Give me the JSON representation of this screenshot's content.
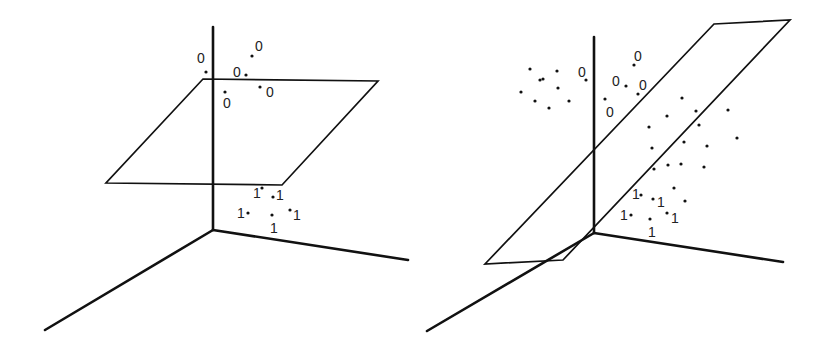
{
  "colors": {
    "ink": "#111111",
    "label": "#222222",
    "background": "#ffffff"
  },
  "panels": [
    {
      "name": "left-panel-horizontal-plane",
      "axes": {
        "origin": [
          213,
          230
        ],
        "vertical_top": [
          213,
          27
        ],
        "left_end": [
          45,
          330
        ],
        "right_end": [
          408,
          260
        ]
      },
      "plane": [
        [
          203,
          79
        ],
        [
          378,
          81
        ],
        [
          282,
          185
        ],
        [
          106,
          183
        ]
      ],
      "labeled_points": [
        {
          "label": "0",
          "dot": [
            206,
            72
          ],
          "text": [
            197,
            63
          ]
        },
        {
          "label": "0",
          "dot": [
            252,
            56
          ],
          "text": [
            255,
            51
          ]
        },
        {
          "label": "0",
          "dot": [
            246,
            75
          ],
          "text": [
            233,
            77
          ]
        },
        {
          "label": "0",
          "dot": [
            225,
            92
          ],
          "text": [
            223,
            108
          ]
        },
        {
          "label": "0",
          "dot": [
            260,
            87
          ],
          "text": [
            266,
            97
          ]
        },
        {
          "label": "1",
          "dot": [
            262,
            188
          ],
          "text": [
            253,
            198
          ]
        },
        {
          "label": "1",
          "dot": [
            273,
            197
          ],
          "text": [
            276,
            200
          ]
        },
        {
          "label": "1",
          "dot": [
            248,
            213
          ],
          "text": [
            237,
            218
          ]
        },
        {
          "label": "1",
          "dot": [
            290,
            210
          ],
          "text": [
            293,
            220
          ]
        },
        {
          "label": "1",
          "dot": [
            272,
            215
          ],
          "text": [
            270,
            233
          ]
        }
      ],
      "unlabeled_points": []
    },
    {
      "name": "right-panel-tilted-plane",
      "axes": {
        "origin": [
          594,
          233
        ],
        "vertical_top": [
          594,
          37
        ],
        "left_end": [
          427,
          331
        ],
        "right_end": [
          783,
          262
        ]
      },
      "plane": [
        [
          714,
          24
        ],
        [
          790,
          20
        ],
        [
          563,
          260
        ],
        [
          485,
          264
        ]
      ],
      "labeled_points": [
        {
          "label": "0",
          "dot": [
            586,
            80
          ],
          "text": [
            578,
            77
          ]
        },
        {
          "label": "0",
          "dot": [
            634,
            65
          ],
          "text": [
            634,
            61
          ]
        },
        {
          "label": "0",
          "dot": [
            626,
            86
          ],
          "text": [
            612,
            86
          ]
        },
        {
          "label": "0",
          "dot": [
            638,
            94
          ],
          "text": [
            639,
            90
          ]
        },
        {
          "label": "0",
          "dot": [
            605,
            99
          ],
          "text": [
            606,
            117
          ]
        },
        {
          "label": "1",
          "dot": [
            641,
            195
          ],
          "text": [
            632,
            199
          ]
        },
        {
          "label": "1",
          "dot": [
            653,
            199
          ],
          "text": [
            657,
            207
          ]
        },
        {
          "label": "1",
          "dot": [
            631,
            215
          ],
          "text": [
            620,
            220
          ]
        },
        {
          "label": "1",
          "dot": [
            667,
            213
          ],
          "text": [
            671,
            223
          ]
        },
        {
          "label": "1",
          "dot": [
            650,
            219
          ],
          "text": [
            648,
            237
          ]
        }
      ],
      "unlabeled_points": [
        [
          530,
          69
        ],
        [
          557,
          71
        ],
        [
          543,
          79
        ],
        [
          558,
          88
        ],
        [
          521,
          92
        ],
        [
          535,
          101
        ],
        [
          569,
          101
        ],
        [
          549,
          108
        ],
        [
          682,
          98
        ],
        [
          667,
          116
        ],
        [
          696,
          111
        ],
        [
          728,
          110
        ],
        [
          649,
          127
        ],
        [
          699,
          125
        ],
        [
          737,
          138
        ],
        [
          652,
          148
        ],
        [
          684,
          142
        ],
        [
          707,
          146
        ],
        [
          668,
          165
        ],
        [
          681,
          164
        ],
        [
          704,
          167
        ],
        [
          654,
          169
        ],
        [
          674,
          188
        ],
        [
          685,
          201
        ],
        [
          540,
          80
        ]
      ]
    }
  ]
}
